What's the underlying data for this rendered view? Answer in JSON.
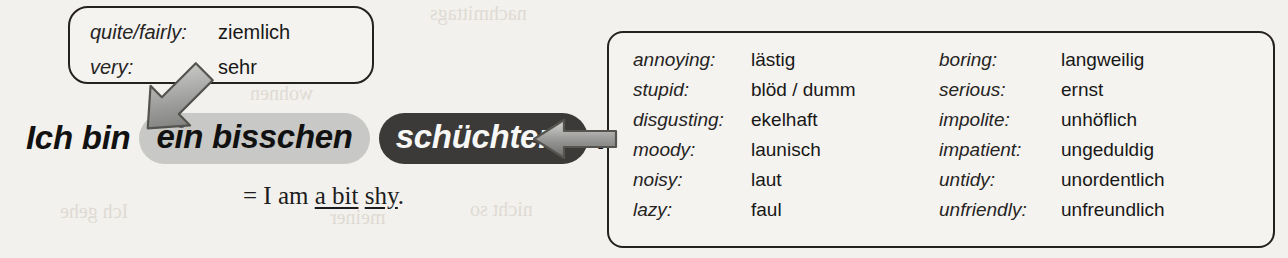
{
  "page": {
    "background_color": "#f3f1ed",
    "ghost_text": [
      {
        "text": "nachmittags",
        "x": 430,
        "y": 2
      },
      {
        "text": "der Woche",
        "x": 120,
        "y": 30
      },
      {
        "text": "wohnen",
        "x": 250,
        "y": 82
      },
      {
        "text": "Ich gehe",
        "x": 60,
        "y": 200
      },
      {
        "text": "meiner",
        "x": 330,
        "y": 206
      },
      {
        "text": "nicht so",
        "x": 470,
        "y": 198
      }
    ]
  },
  "adverb_callout": {
    "name": "intensifier-callout",
    "rows": [
      {
        "term": "quite/fairly:",
        "gloss": "ziemlich"
      },
      {
        "term": "very:",
        "gloss": "sehr"
      }
    ]
  },
  "adjective_callout": {
    "name": "adjective-vocabulary-callout",
    "left_column": [
      {
        "term": "annoying:",
        "gloss": "lästig"
      },
      {
        "term": "stupid:",
        "gloss": "blöd / dumm"
      },
      {
        "term": "disgusting:",
        "gloss": "ekelhaft"
      },
      {
        "term": "moody:",
        "gloss": "launisch"
      },
      {
        "term": "noisy:",
        "gloss": "laut"
      },
      {
        "term": "lazy:",
        "gloss": "faul"
      }
    ],
    "right_column": [
      {
        "term": "boring:",
        "gloss": "langweilig"
      },
      {
        "term": "serious:",
        "gloss": "ernst"
      },
      {
        "term": "impolite:",
        "gloss": "unhöflich"
      },
      {
        "term": "impatient:",
        "gloss": "ungeduldig"
      },
      {
        "term": "untidy:",
        "gloss": "unordentlich"
      },
      {
        "term": "unfriendly:",
        "gloss": "unfreundlich"
      }
    ]
  },
  "sentence": {
    "word_1": "Ich",
    "word_2": "bin",
    "quantifier_pill": "ein bisschen",
    "adjective_pill": "schüchtern",
    "period": ".",
    "quantifier_pill_color": "#c8c8c6",
    "adjective_pill_color": "#3b3a38"
  },
  "translation": {
    "equals": "=",
    "lead": "I am",
    "underlined_1": "a bit",
    "underlined_2": "shy",
    "period": "."
  },
  "arrows": {
    "to_quantifier": {
      "icon": "block-arrow-down-right-icon",
      "color": "#8e8e8c"
    },
    "to_adjective": {
      "icon": "block-arrow-left-icon",
      "color": "#8e8e8c"
    }
  }
}
